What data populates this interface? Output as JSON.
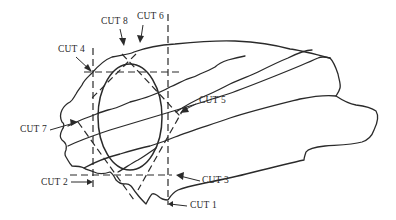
{
  "diagram": {
    "labels": {
      "cut1": "CUT 1",
      "cut2": "CUT 2",
      "cut3": "CUT 3",
      "cut4": "CUT 4",
      "cut5": "CUT 5",
      "cut6": "CUT 6",
      "cut7": "CUT 7",
      "cut8": "CUT 8"
    },
    "colors": {
      "ink": "#2a2a2a",
      "background": "#ffffff"
    }
  }
}
